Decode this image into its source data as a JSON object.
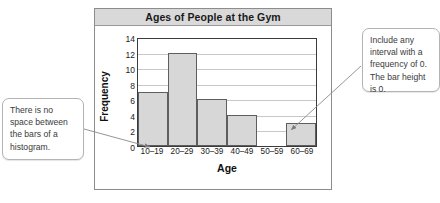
{
  "chart_data": {
    "type": "bar",
    "title": "Ages of People at the Gym",
    "xlabel": "Age",
    "ylabel": "Frequency",
    "categories": [
      "10–19",
      "20–29",
      "30–39",
      "40–49",
      "50–59",
      "60–69"
    ],
    "values": [
      7,
      12,
      6,
      4,
      0,
      3
    ],
    "ylim": [
      0,
      14
    ],
    "yticks": [
      0,
      2,
      4,
      6,
      8,
      10,
      12,
      14
    ],
    "grid": true,
    "legend": null,
    "bar_fill_color": "#d7d7d7",
    "bar_border_color": "#5e5e5e",
    "axis_color": "#3b3b3b",
    "gridline_color": "#c8c8c8",
    "title_bar_color": "#d9d9d9"
  },
  "annotations": {
    "left_callout": {
      "text": "There is no space between the bars of a histogram.",
      "points_to": "10–19 bar base"
    },
    "right_callout": {
      "text": "Include any interval with a frequency of 0. The bar height is 0.",
      "points_to": "50–59 interval"
    }
  }
}
